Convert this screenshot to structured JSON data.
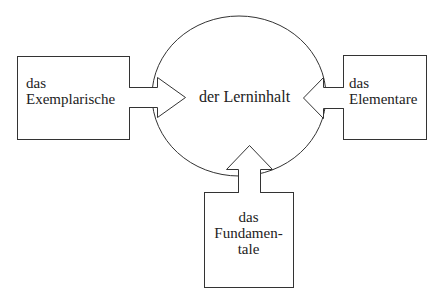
{
  "diagram": {
    "center": {
      "label": "der Lerninhalt"
    },
    "left": {
      "lines": [
        "das",
        "Exemplarische"
      ]
    },
    "right": {
      "lines": [
        "das",
        "Elementare"
      ]
    },
    "bottom": {
      "lines": [
        "das",
        "Fundamen-",
        "tale"
      ]
    },
    "colors": {
      "stroke": "#333333",
      "background": "#ffffff",
      "text": "#222222"
    }
  }
}
